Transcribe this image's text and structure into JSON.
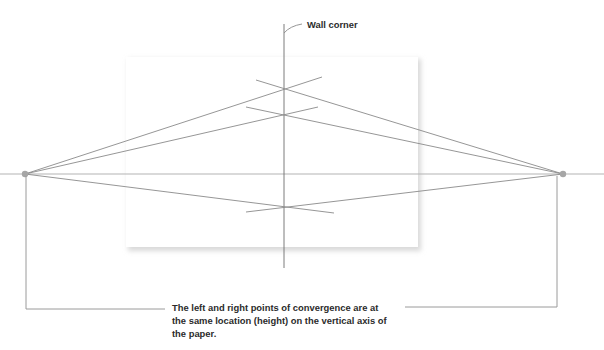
{
  "figure": {
    "top_cut_text": "",
    "wall_corner_label": "Wall corner",
    "caption_lines": [
      "The left and right points of convergence are at",
      "the same location (height) on the vertical axis of",
      "the paper."
    ],
    "elements": {
      "paper": "sheet of paper",
      "horizon": "horizon line",
      "vertical_axis": "wall corner line",
      "vanishing_points": [
        "left vanishing point",
        "right vanishing point"
      ]
    },
    "colors": {
      "guide_lines": "#8a8a8a",
      "horizon": "#b3b3b3",
      "vanishing_point": "#a6a6a6",
      "text": "#2b2b2b"
    }
  }
}
